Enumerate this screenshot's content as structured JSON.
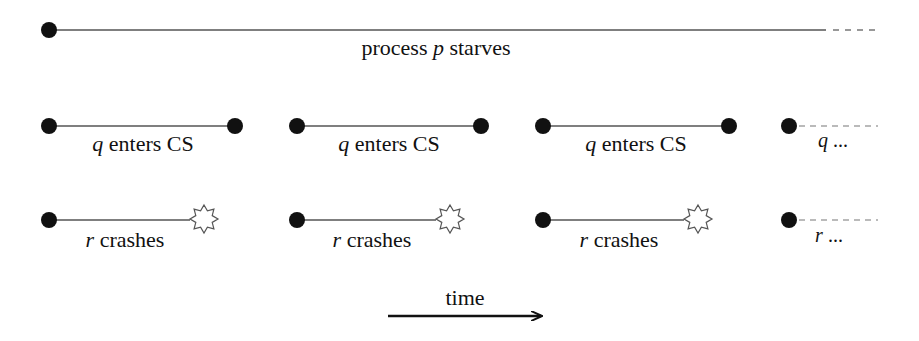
{
  "diagram": {
    "top": {
      "label_prefix": "process",
      "label_var": "p",
      "label_suffix": "starves"
    },
    "q_row": {
      "segments": [
        {
          "var": "q",
          "text": "enters CS"
        },
        {
          "var": "q",
          "text": "enters CS"
        },
        {
          "var": "q",
          "text": "enters CS"
        }
      ],
      "tail": {
        "var": "q",
        "text": "..."
      }
    },
    "r_row": {
      "segments": [
        {
          "var": "r",
          "text": "crashes"
        },
        {
          "var": "r",
          "text": "crashes"
        },
        {
          "var": "r",
          "text": "crashes"
        }
      ],
      "tail": {
        "var": "r",
        "text": "..."
      }
    },
    "time_axis": {
      "label": "time"
    },
    "colors": {
      "ink": "#111111",
      "line": "#555555"
    }
  }
}
